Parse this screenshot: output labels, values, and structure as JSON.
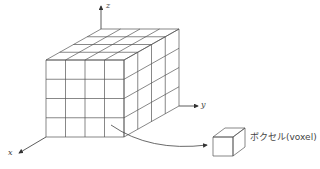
{
  "diagram": {
    "grid_divisions": {
      "x": 4,
      "y": 4,
      "z": 4
    },
    "axes": {
      "x_label": "x",
      "y_label": "y",
      "z_label": "z"
    },
    "voxel_label": "ボクセル(voxel)",
    "colors": {
      "line": "#555555",
      "axis": "#333333",
      "text": "#444444",
      "background": "#ffffff"
    }
  }
}
